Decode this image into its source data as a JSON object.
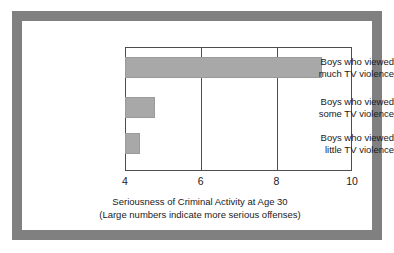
{
  "chart_data": {
    "type": "bar",
    "orientation": "horizontal",
    "title": "",
    "xlabel_line1": "Seriousness of Criminal Activity at Age 30",
    "xlabel_line2": "(Large numbers indicate more serious offenses)",
    "ylabel": "",
    "categories": [
      "Boys who viewed much TV violence",
      "Boys who viewed some TV violence",
      "Boys who viewed little TV violence"
    ],
    "category_lines": [
      [
        "Boys who viewed",
        "much TV violence"
      ],
      [
        "Boys who viewed",
        "some TV violence"
      ],
      [
        "Boys who viewed",
        "little TV violence"
      ]
    ],
    "values": [
      9.2,
      4.8,
      4.4
    ],
    "xlim": [
      4,
      10
    ],
    "xticks": [
      4,
      6,
      8,
      10
    ],
    "xtick_labels": [
      "4",
      "6",
      "8",
      "10"
    ],
    "grid": "vertical gridlines at 6 and 8",
    "legend": "none",
    "bar_color": "#a8a8a8",
    "frame_color": "#808080",
    "axis_color": "#4d4d4d",
    "text_color": "#1a1a1a"
  }
}
